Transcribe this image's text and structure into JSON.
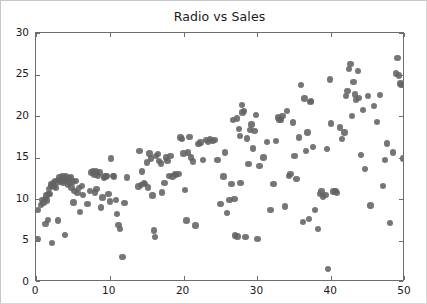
{
  "figure": {
    "background_color": "#ffffff",
    "frame_color": "#c8c8c8",
    "axes_color": "#6e6e6e"
  },
  "chart_data": {
    "type": "scatter",
    "title": "Radio vs Sales",
    "xlabel": "",
    "ylabel": "",
    "xlim": [
      0,
      50
    ],
    "ylim": [
      0,
      30
    ],
    "xticks": [
      0,
      10,
      20,
      30,
      40,
      50
    ],
    "yticks": [
      0,
      5,
      10,
      15,
      20,
      25,
      30
    ],
    "grid": false,
    "legend": null,
    "marker": {
      "shape": "circle",
      "color": "#636363",
      "size_px": 6.4,
      "opacity": 0.88
    },
    "series": [
      {
        "name": "Radio vs Sales",
        "points": [
          [
            0.2,
            5.2
          ],
          [
            0.3,
            8.7
          ],
          [
            0.7,
            9.3
          ],
          [
            0.8,
            9.9
          ],
          [
            1.0,
            9.5
          ],
          [
            1.2,
            10.0
          ],
          [
            1.3,
            7.0
          ],
          [
            1.4,
            10.4
          ],
          [
            1.5,
            9.8
          ],
          [
            1.6,
            7.5
          ],
          [
            1.7,
            10.6
          ],
          [
            1.8,
            11.2
          ],
          [
            1.9,
            10.6
          ],
          [
            2.0,
            11.8
          ],
          [
            2.1,
            11.6
          ],
          [
            2.2,
            4.7
          ],
          [
            2.3,
            11.9
          ],
          [
            2.4,
            11.5
          ],
          [
            2.6,
            12.2
          ],
          [
            2.7,
            11.3
          ],
          [
            2.8,
            12.0
          ],
          [
            3.0,
            7.4
          ],
          [
            3.1,
            12.3
          ],
          [
            3.2,
            12.6
          ],
          [
            3.4,
            12.1
          ],
          [
            3.5,
            12.4
          ],
          [
            3.6,
            12.7
          ],
          [
            3.7,
            11.9
          ],
          [
            3.8,
            12.5
          ],
          [
            3.9,
            5.7
          ],
          [
            4.0,
            12.2
          ],
          [
            4.1,
            12.8
          ],
          [
            4.2,
            12.3
          ],
          [
            4.3,
            11.7
          ],
          [
            4.4,
            12.5
          ],
          [
            4.6,
            12.0
          ],
          [
            4.7,
            12.6
          ],
          [
            4.8,
            11.4
          ],
          [
            5.0,
            12.1
          ],
          [
            5.1,
            9.6
          ],
          [
            5.2,
            11.0
          ],
          [
            5.4,
            12.2
          ],
          [
            5.6,
            10.7
          ],
          [
            5.8,
            11.3
          ],
          [
            6.0,
            8.4
          ],
          [
            6.2,
            11.6
          ],
          [
            6.4,
            10.5
          ],
          [
            7.0,
            9.4
          ],
          [
            7.3,
            11.0
          ],
          [
            7.5,
            13.2
          ],
          [
            7.7,
            13.3
          ],
          [
            7.9,
            12.9
          ],
          [
            8.0,
            10.8
          ],
          [
            8.1,
            13.4
          ],
          [
            8.2,
            11.2
          ],
          [
            8.3,
            13.1
          ],
          [
            8.4,
            12.8
          ],
          [
            8.6,
            13.2
          ],
          [
            8.8,
            9.0
          ],
          [
            9.0,
            10.2
          ],
          [
            9.2,
            12.6
          ],
          [
            9.4,
            12.7
          ],
          [
            9.6,
            12.8
          ],
          [
            9.8,
            10.6
          ],
          [
            10.0,
            9.7
          ],
          [
            10.2,
            14.9
          ],
          [
            10.4,
            12.8
          ],
          [
            10.6,
            12.7
          ],
          [
            10.8,
            9.9
          ],
          [
            11.0,
            8.2
          ],
          [
            11.2,
            6.9
          ],
          [
            11.4,
            6.4
          ],
          [
            11.7,
            3.0
          ],
          [
            12.0,
            9.5
          ],
          [
            12.3,
            12.6
          ],
          [
            13.9,
            11.5
          ],
          [
            14.0,
            15.8
          ],
          [
            14.2,
            11.7
          ],
          [
            14.4,
            13.3
          ],
          [
            14.6,
            11.9
          ],
          [
            14.8,
            11.8
          ],
          [
            15.0,
            14.4
          ],
          [
            15.2,
            11.4
          ],
          [
            15.4,
            15.5
          ],
          [
            15.6,
            14.9
          ],
          [
            15.8,
            10.4
          ],
          [
            16.0,
            6.2
          ],
          [
            16.1,
            5.4
          ],
          [
            16.3,
            15.2
          ],
          [
            16.5,
            15.4
          ],
          [
            16.7,
            14.6
          ],
          [
            16.9,
            14.3
          ],
          [
            17.1,
            10.8
          ],
          [
            17.4,
            11.9
          ],
          [
            17.6,
            15.0
          ],
          [
            17.8,
            14.6
          ],
          [
            18.0,
            12.8
          ],
          [
            18.2,
            15.2
          ],
          [
            18.5,
            12.7
          ],
          [
            18.8,
            13.0
          ],
          [
            19.0,
            12.9
          ],
          [
            19.3,
            13.0
          ],
          [
            19.6,
            17.4
          ],
          [
            19.8,
            17.2
          ],
          [
            20.0,
            15.5
          ],
          [
            20.2,
            11.1
          ],
          [
            20.4,
            7.4
          ],
          [
            20.6,
            15.6
          ],
          [
            20.8,
            17.5
          ],
          [
            21.0,
            15.0
          ],
          [
            21.3,
            14.5
          ],
          [
            21.6,
            6.8
          ],
          [
            22.0,
            16.6
          ],
          [
            22.3,
            16.8
          ],
          [
            22.6,
            14.7
          ],
          [
            23.0,
            17.1
          ],
          [
            23.3,
            16.9
          ],
          [
            23.6,
            17.2
          ],
          [
            23.9,
            17.0
          ],
          [
            24.2,
            17.1
          ],
          [
            24.6,
            14.7
          ],
          [
            25.0,
            9.4
          ],
          [
            25.4,
            12.7
          ],
          [
            25.6,
            15.6
          ],
          [
            25.9,
            8.3
          ],
          [
            26.2,
            9.9
          ],
          [
            26.5,
            11.8
          ],
          [
            26.7,
            19.5
          ],
          [
            26.9,
            10.0
          ],
          [
            27.0,
            5.6
          ],
          [
            27.2,
            19.7
          ],
          [
            27.3,
            5.5
          ],
          [
            27.5,
            18.4
          ],
          [
            27.6,
            17.6
          ],
          [
            27.7,
            11.9
          ],
          [
            27.9,
            21.3
          ],
          [
            28.0,
            20.4
          ],
          [
            28.2,
            20.6
          ],
          [
            28.4,
            5.4
          ],
          [
            28.6,
            17.3
          ],
          [
            28.8,
            14.2
          ],
          [
            29.0,
            18.3
          ],
          [
            29.2,
            19.0
          ],
          [
            29.4,
            16.1
          ],
          [
            29.6,
            18.2
          ],
          [
            29.8,
            20.1
          ],
          [
            30.0,
            5.2
          ],
          [
            30.3,
            14.0
          ],
          [
            30.8,
            15.0
          ],
          [
            31.3,
            16.9
          ],
          [
            31.8,
            8.7
          ],
          [
            32.2,
            11.8
          ],
          [
            32.5,
            17.0
          ],
          [
            32.8,
            19.8
          ],
          [
            33.0,
            19.5
          ],
          [
            33.2,
            19.6
          ],
          [
            33.4,
            20.0
          ],
          [
            33.7,
            9.1
          ],
          [
            34.0,
            20.6
          ],
          [
            34.3,
            12.8
          ],
          [
            34.5,
            13.0
          ],
          [
            34.8,
            19.2
          ],
          [
            35.0,
            15.2
          ],
          [
            35.3,
            12.4
          ],
          [
            35.6,
            17.4
          ],
          [
            35.9,
            23.7
          ],
          [
            36.2,
            7.2
          ],
          [
            36.4,
            22.1
          ],
          [
            36.6,
            15.8
          ],
          [
            36.8,
            18.0
          ],
          [
            37.0,
            7.6
          ],
          [
            37.2,
            21.7
          ],
          [
            37.3,
            21.8
          ],
          [
            37.5,
            16.3
          ],
          [
            37.8,
            8.7
          ],
          [
            38.2,
            6.4
          ],
          [
            38.5,
            10.6
          ],
          [
            38.7,
            11.0
          ],
          [
            38.9,
            10.3
          ],
          [
            39.2,
            10.5
          ],
          [
            39.4,
            16.0
          ],
          [
            39.6,
            1.6
          ],
          [
            39.8,
            24.4
          ],
          [
            40.0,
            19.1
          ],
          [
            40.3,
            10.9
          ],
          [
            40.6,
            11.0
          ],
          [
            40.8,
            10.7
          ],
          [
            41.2,
            18.6
          ],
          [
            41.5,
            17.2
          ],
          [
            41.8,
            18.0
          ],
          [
            42.0,
            22.4
          ],
          [
            42.2,
            23.0
          ],
          [
            42.4,
            25.7
          ],
          [
            42.6,
            26.3
          ],
          [
            42.8,
            20.0
          ],
          [
            43.0,
            24.1
          ],
          [
            43.2,
            22.6
          ],
          [
            43.4,
            21.9
          ],
          [
            43.6,
            25.4
          ],
          [
            43.8,
            22.2
          ],
          [
            44.0,
            15.3
          ],
          [
            44.3,
            20.7
          ],
          [
            44.6,
            13.6
          ],
          [
            45.0,
            22.4
          ],
          [
            45.3,
            9.2
          ],
          [
            45.8,
            21.2
          ],
          [
            46.2,
            19.3
          ],
          [
            46.6,
            22.5
          ],
          [
            47.0,
            11.6
          ],
          [
            47.3,
            14.7
          ],
          [
            47.6,
            16.7
          ],
          [
            48.0,
            7.1
          ],
          [
            48.4,
            15.6
          ],
          [
            48.8,
            25.1
          ],
          [
            49.0,
            27.0
          ],
          [
            49.2,
            24.9
          ],
          [
            49.4,
            23.9
          ],
          [
            49.5,
            23.7
          ],
          [
            49.7,
            14.9
          ]
        ]
      }
    ]
  }
}
